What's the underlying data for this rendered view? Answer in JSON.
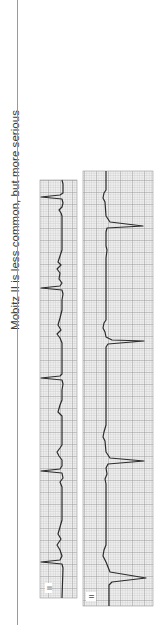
{
  "page": {
    "caption": "Mobitz II is less common, but more serious",
    "orientation": "rotated-90-ccw"
  },
  "strips": [
    {
      "id": "strip-1",
      "lead_label": "II",
      "qrs_positions_y": [
        197,
        288,
        378,
        471,
        562
      ],
      "description": "ECG rhythm strip with P waves and QRS complexes"
    },
    {
      "id": "strip-2",
      "lead_label": "II",
      "qrs_positions_y": [
        226,
        341,
        461,
        578
      ],
      "description": "ECG rhythm strip showing Mobitz II pattern"
    }
  ],
  "colors": {
    "grid_minor": "#b8b8b8",
    "grid_major": "#8c8c8c",
    "trace": "#2a2a2a",
    "paper": "#ebebeb"
  }
}
